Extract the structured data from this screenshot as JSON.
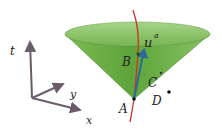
{
  "diagram": {
    "axes": {
      "t_label": "t",
      "x_label": "x",
      "y_label": "y",
      "color": "#6b5b6b"
    },
    "cone": {
      "fill": "#6fb34a",
      "top_fill": "#8fc86a",
      "edge": "#4e8f32"
    },
    "worldline": {
      "color": "#cc3322"
    },
    "vector": {
      "label_main": "u",
      "label_sup": "a",
      "color": "#2a6a9a"
    },
    "points": {
      "A": "A",
      "B": "B",
      "C": "C",
      "D": "D"
    }
  }
}
